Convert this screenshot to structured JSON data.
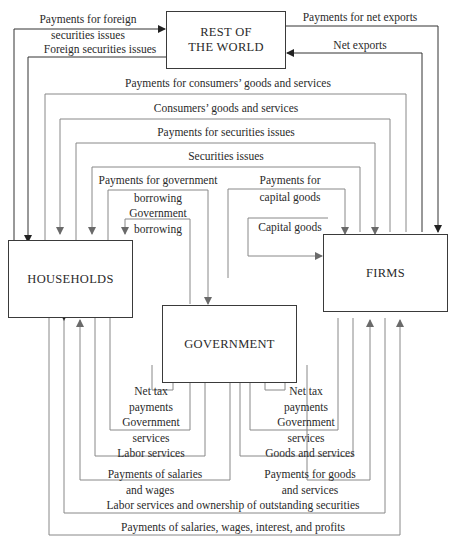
{
  "diagram": {
    "type": "circular-flow",
    "nodes": {
      "rest_of_world": "REST OF\nTHE WORLD",
      "rest_of_world_line1": "REST OF",
      "rest_of_world_line2": "THE WORLD",
      "households": "HOUSEHOLDS",
      "firms": "FIRMS",
      "government": "GOVERNMENT"
    },
    "top_flows": {
      "pay_foreign_sec_1": "Payments for foreign",
      "pay_foreign_sec_2": "securities issues",
      "foreign_sec": "Foreign securities issues",
      "pay_net_exports": "Payments for net exports",
      "net_exports": "Net exports",
      "pay_consumer_goods": "Payments for consumers’ goods and services",
      "consumer_goods": "Consumers’ goods and services",
      "pay_securities": "Payments for securities issues",
      "securities": "Securities issues",
      "pay_gov_borrowing_1": "Payments for government",
      "pay_gov_borrowing_2": "borrowing",
      "gov_borrowing_1": "Government",
      "gov_borrowing_2": "borrowing",
      "pay_capital_goods_1": "Payments for",
      "pay_capital_goods_2": "capital goods",
      "capital_goods": "Capital goods"
    },
    "bottom_flows": {
      "hh_net_tax_1": "Net tax",
      "hh_net_tax_2": "payments",
      "hh_gov_services_1": "Government",
      "hh_gov_services_2": "services",
      "labor_services": "Labor services",
      "pay_salaries_1": "Payments of salaries",
      "pay_salaries_2": "and wages",
      "firm_net_tax_1": "Net tax",
      "firm_net_tax_2": "payments",
      "firm_gov_services_1": "Government",
      "firm_gov_services_2": "services",
      "goods_services": "Goods and services",
      "pay_goods_1": "Payments for goods",
      "pay_goods_2": "and services",
      "labor_ownership": "Labor services and ownership of outstanding securities",
      "pay_salaries_profits": "Payments of salaries, wages, interest, and profits"
    }
  }
}
